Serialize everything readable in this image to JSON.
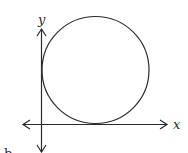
{
  "diagram": {
    "type": "circle tangent to both coordinate axes in the first quadrant",
    "labels": {
      "y_axis": "y",
      "x_axis": "x",
      "caption": "b"
    },
    "colors": {
      "stroke": "#2a2a2a",
      "background": "#ffffff"
    }
  }
}
